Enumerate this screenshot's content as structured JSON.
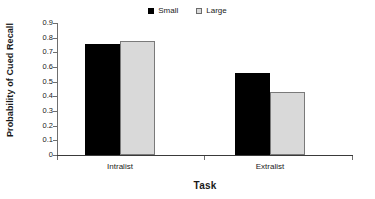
{
  "chart_data": {
    "type": "bar",
    "title": "",
    "xlabel": "Task",
    "ylabel": "Probability of Cued Recall",
    "categories": [
      "Intralist",
      "Extralist"
    ],
    "series": [
      {
        "name": "Small",
        "values": [
          0.76,
          0.56
        ],
        "color": "#000000"
      },
      {
        "name": "Large",
        "values": [
          0.78,
          0.43
        ],
        "color": "#d9d9d9"
      }
    ],
    "ylim": [
      0,
      0.9
    ],
    "ytick_labels": [
      "0.9",
      "0.8",
      "0.7",
      "0.6",
      "0.5",
      "0.4",
      "0.3",
      "0.2",
      "0.1",
      "0"
    ],
    "ytick_values": [
      0.9,
      0.8,
      0.7,
      0.6,
      0.5,
      0.4,
      0.3,
      0.2,
      0.1,
      0
    ],
    "grid": false,
    "legend_position": "top-center",
    "background": "#ffffff",
    "axis_color": "#6e6e6e"
  },
  "legend": {
    "entries": [
      {
        "label": "Small",
        "swatch": "filled-square-icon"
      },
      {
        "label": "Large",
        "swatch": "open-square-icon"
      }
    ]
  },
  "axes": {
    "y_title": "Probability of Cued Recall",
    "x_title": "Task"
  }
}
